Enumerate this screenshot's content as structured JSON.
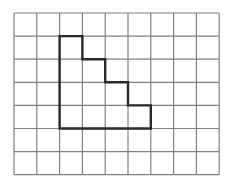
{
  "figure": {
    "background_color": "#ffffff"
  },
  "chart_data": {
    "type": "diagram",
    "title": "",
    "subtitle": "",
    "xlabel": "",
    "ylabel": "",
    "grid": {
      "columns": 9,
      "rows": 7,
      "cell_width_px": 22.8,
      "cell_height_px": 23.1,
      "origin_x_px": 14,
      "origin_y_px": 13,
      "line_color": "#808080",
      "line_width_px": 1.2,
      "show": true
    },
    "shape": {
      "name": "staircase-polygon",
      "kind": "closed-orthogonal-polygon",
      "stroke_color": "#2a2a2a",
      "stroke_width_px": 2.4,
      "fill": "none",
      "area_cells": 14,
      "perimeter_cells": 22,
      "vertices_grid": [
        [
          2,
          1
        ],
        [
          3,
          1
        ],
        [
          3,
          2
        ],
        [
          4,
          2
        ],
        [
          4,
          3
        ],
        [
          5,
          3
        ],
        [
          5,
          4
        ],
        [
          6,
          4
        ],
        [
          6,
          5
        ],
        [
          2,
          5
        ]
      ],
      "column_heights_cells": [
        4,
        3,
        2,
        1
      ],
      "step_count": 4
    },
    "legend": {
      "show": false,
      "entries": []
    },
    "annotations": [],
    "tick_labels": {
      "x": [],
      "y": []
    }
  }
}
